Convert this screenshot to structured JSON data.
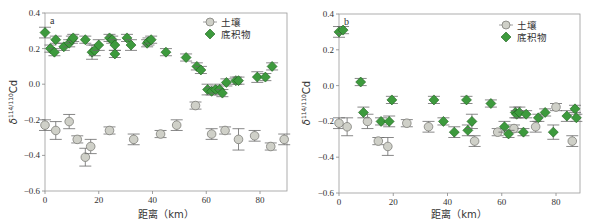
{
  "colors": {
    "soil_fill": "#cfd0c8",
    "soil_stroke": "#7d7d78",
    "sediment_fill": "#3d9a3d",
    "sediment_stroke": "#1f5f1f",
    "errorbar": "#6a6a6a",
    "axis": "#888888"
  },
  "chart_data": [
    {
      "type": "scatter",
      "panel": "a",
      "title": "",
      "xlabel": "距离（km）",
      "ylabel": "δ114/110Cd",
      "xlim": [
        0,
        90
      ],
      "ylim": [
        -0.6,
        0.4
      ],
      "xticks": [
        0,
        20,
        40,
        60,
        80
      ],
      "yticks": [
        -0.6,
        -0.4,
        -0.2,
        0.0,
        0.2,
        0.4
      ],
      "legend": [
        "土壤",
        "底积物"
      ],
      "legend_position": "upper right",
      "grid": false,
      "series": [
        {
          "name": "土壤",
          "marker": "circle",
          "points": [
            {
              "x": 0,
              "y": -0.23,
              "err": 0.03
            },
            {
              "x": 4,
              "y": -0.26,
              "err": 0.05
            },
            {
              "x": 9,
              "y": -0.21,
              "err": 0.04
            },
            {
              "x": 12,
              "y": -0.31,
              "err": 0.02
            },
            {
              "x": 15,
              "y": -0.41,
              "err": 0.05
            },
            {
              "x": 17,
              "y": -0.35,
              "err": 0.04
            },
            {
              "x": 24,
              "y": -0.26,
              "err": 0.02
            },
            {
              "x": 33,
              "y": -0.31,
              "err": 0.03
            },
            {
              "x": 43,
              "y": -0.28,
              "err": 0.02
            },
            {
              "x": 49,
              "y": -0.23,
              "err": 0.03
            },
            {
              "x": 56,
              "y": -0.12,
              "err": 0.02
            },
            {
              "x": 62,
              "y": -0.28,
              "err": 0.03
            },
            {
              "x": 67,
              "y": -0.26,
              "err": 0.02
            },
            {
              "x": 72,
              "y": -0.31,
              "err": 0.06
            },
            {
              "x": 78,
              "y": -0.29,
              "err": 0.03
            },
            {
              "x": 84,
              "y": -0.35,
              "err": 0.02
            },
            {
              "x": 89,
              "y": -0.31,
              "err": 0.03
            }
          ]
        },
        {
          "name": "底积物",
          "marker": "diamond",
          "points": [
            {
              "x": 0,
              "y": 0.29,
              "err": 0.03
            },
            {
              "x": 2,
              "y": 0.2,
              "err": 0.02
            },
            {
              "x": 3.5,
              "y": 0.18,
              "err": 0.02
            },
            {
              "x": 4,
              "y": 0.25,
              "err": 0.02
            },
            {
              "x": 7,
              "y": 0.21,
              "err": 0.02
            },
            {
              "x": 9,
              "y": 0.23,
              "err": 0.02
            },
            {
              "x": 10,
              "y": 0.25,
              "err": 0.02
            },
            {
              "x": 10.5,
              "y": 0.26,
              "err": 0.02
            },
            {
              "x": 15,
              "y": 0.25,
              "err": 0.02
            },
            {
              "x": 17.5,
              "y": 0.18,
              "err": 0.04
            },
            {
              "x": 18.5,
              "y": 0.19,
              "err": 0.03
            },
            {
              "x": 20,
              "y": 0.22,
              "err": 0.03
            },
            {
              "x": 24,
              "y": 0.26,
              "err": 0.02
            },
            {
              "x": 25,
              "y": 0.25,
              "err": 0.02
            },
            {
              "x": 26,
              "y": 0.22,
              "err": 0.03
            },
            {
              "x": 26,
              "y": 0.17,
              "err": 0.02
            },
            {
              "x": 30.5,
              "y": 0.26,
              "err": 0.02
            },
            {
              "x": 32,
              "y": 0.22,
              "err": 0.03
            },
            {
              "x": 38,
              "y": 0.23,
              "err": 0.02
            },
            {
              "x": 38.5,
              "y": 0.24,
              "err": 0.02
            },
            {
              "x": 39.5,
              "y": 0.25,
              "err": 0.02
            },
            {
              "x": 45,
              "y": 0.18,
              "err": 0.02
            },
            {
              "x": 52.5,
              "y": 0.15,
              "err": 0.02
            },
            {
              "x": 56.5,
              "y": 0.1,
              "err": 0.02
            },
            {
              "x": 58,
              "y": 0.08,
              "err": 0.02
            },
            {
              "x": 60.5,
              "y": -0.03,
              "err": 0.03
            },
            {
              "x": 62,
              "y": -0.04,
              "err": 0.02
            },
            {
              "x": 63.5,
              "y": -0.03,
              "err": 0.02
            },
            {
              "x": 65,
              "y": -0.03,
              "err": 0.03
            },
            {
              "x": 66,
              "y": -0.05,
              "err": 0.02
            },
            {
              "x": 67.5,
              "y": 0.01,
              "err": 0.02
            },
            {
              "x": 71,
              "y": 0.02,
              "err": 0.02
            },
            {
              "x": 72,
              "y": 0.02,
              "err": 0.02
            },
            {
              "x": 79,
              "y": 0.04,
              "err": 0.03
            },
            {
              "x": 82,
              "y": 0.04,
              "err": 0.02
            },
            {
              "x": 84.5,
              "y": 0.1,
              "err": 0.02
            }
          ]
        }
      ]
    },
    {
      "type": "scatter",
      "panel": "b",
      "title": "",
      "xlabel": "距离（km）",
      "ylabel": "δ114/110Cd",
      "xlim": [
        0,
        90
      ],
      "ylim": [
        -0.6,
        0.4
      ],
      "xticks": [
        0,
        20,
        40,
        60,
        80
      ],
      "yticks": [
        -0.6,
        -0.4,
        -0.2,
        0.0,
        0.2,
        0.4
      ],
      "legend": [
        "土壤",
        "底积物"
      ],
      "legend_position": "upper right",
      "grid": false,
      "series": [
        {
          "name": "土壤",
          "marker": "circle",
          "points": [
            {
              "x": 0,
              "y": -0.21,
              "err": 0.03
            },
            {
              "x": 3,
              "y": -0.23,
              "err": 0.05
            },
            {
              "x": 10.5,
              "y": -0.2,
              "err": 0.04
            },
            {
              "x": 14.5,
              "y": -0.31,
              "err": 0.02
            },
            {
              "x": 18,
              "y": -0.34,
              "err": 0.05
            },
            {
              "x": 25,
              "y": -0.21,
              "err": 0.02
            },
            {
              "x": 33,
              "y": -0.23,
              "err": 0.03
            },
            {
              "x": 50,
              "y": -0.31,
              "err": 0.03
            },
            {
              "x": 58.5,
              "y": -0.26,
              "err": 0.02
            },
            {
              "x": 64.5,
              "y": -0.24,
              "err": 0.02
            },
            {
              "x": 72.5,
              "y": -0.23,
              "err": 0.03
            },
            {
              "x": 80,
              "y": -0.12,
              "err": 0.02
            },
            {
              "x": 86,
              "y": -0.31,
              "err": 0.03
            }
          ]
        },
        {
          "name": "底积物",
          "marker": "diamond",
          "points": [
            {
              "x": 0,
              "y": 0.3,
              "err": 0.03
            },
            {
              "x": 1.5,
              "y": 0.31,
              "err": 0.02
            },
            {
              "x": 8,
              "y": 0.02,
              "err": 0.02
            },
            {
              "x": 9,
              "y": -0.15,
              "err": 0.03
            },
            {
              "x": 15.5,
              "y": -0.2,
              "err": 0.02
            },
            {
              "x": 18.5,
              "y": -0.2,
              "err": 0.03
            },
            {
              "x": 19.5,
              "y": -0.08,
              "err": 0.02
            },
            {
              "x": 35,
              "y": -0.08,
              "err": 0.02
            },
            {
              "x": 38.5,
              "y": -0.2,
              "err": 0.02
            },
            {
              "x": 42.5,
              "y": -0.26,
              "err": 0.03
            },
            {
              "x": 47,
              "y": -0.08,
              "err": 0.02
            },
            {
              "x": 47.5,
              "y": -0.25,
              "err": 0.03
            },
            {
              "x": 49,
              "y": -0.2,
              "err": 0.04
            },
            {
              "x": 56,
              "y": -0.1,
              "err": 0.02
            },
            {
              "x": 61,
              "y": -0.23,
              "err": 0.03
            },
            {
              "x": 62.5,
              "y": -0.27,
              "err": 0.02
            },
            {
              "x": 65,
              "y": -0.15,
              "err": 0.03
            },
            {
              "x": 65.5,
              "y": -0.16,
              "err": 0.02
            },
            {
              "x": 66.5,
              "y": -0.15,
              "err": 0.03
            },
            {
              "x": 68,
              "y": -0.26,
              "err": 0.02
            },
            {
              "x": 69,
              "y": -0.16,
              "err": 0.02
            },
            {
              "x": 73.5,
              "y": -0.18,
              "err": 0.02
            },
            {
              "x": 76,
              "y": -0.15,
              "err": 0.02
            },
            {
              "x": 79,
              "y": -0.26,
              "err": 0.04
            },
            {
              "x": 84,
              "y": -0.17,
              "err": 0.03
            },
            {
              "x": 87,
              "y": -0.13,
              "err": 0.02
            },
            {
              "x": 87.5,
              "y": -0.18,
              "err": 0.02
            }
          ]
        }
      ]
    }
  ],
  "panels": [
    {
      "label": "a",
      "xlabel": "距离（km）",
      "ylabel_main": "δ",
      "ylabel_sup": "114/110",
      "ylabel_elem": "Cd",
      "legend_soil": "土壤",
      "legend_sediment": "底积物",
      "xtick_labels": [
        "0",
        "20",
        "40",
        "60",
        "80"
      ],
      "ytick_labels": [
        "0.4",
        "0.2",
        "0.0",
        "−0.2",
        "−0.4",
        "−0.6"
      ]
    },
    {
      "label": "b",
      "xlabel": "距离（km）",
      "ylabel_main": "δ",
      "ylabel_sup": "114/110",
      "ylabel_elem": "Cd",
      "legend_soil": "土壤",
      "legend_sediment": "底积物",
      "xtick_labels": [
        "0",
        "20",
        "40",
        "60",
        "80"
      ],
      "ytick_labels": [
        "0.4",
        "0.2",
        "0.0",
        "−0.2",
        "−0.4",
        "−0.6"
      ]
    }
  ]
}
